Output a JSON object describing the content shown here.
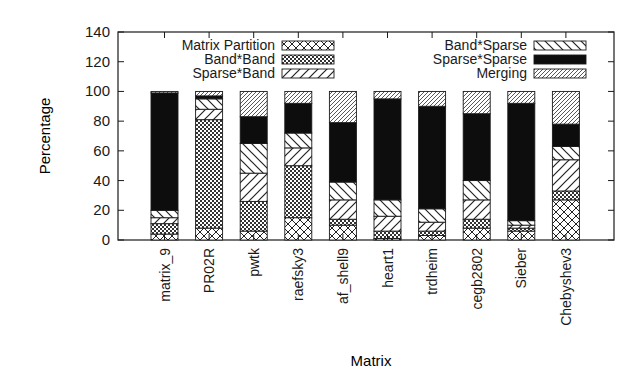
{
  "chart_data": {
    "type": "bar",
    "stacked": true,
    "title": "",
    "xlabel": "Matrix",
    "ylabel": "Percentage",
    "ylim": [
      0,
      140
    ],
    "yticks": [
      0,
      20,
      40,
      60,
      80,
      100,
      120,
      140
    ],
    "grid": false,
    "legend_position": "top-inside, two columns",
    "categories": [
      "matrix_9",
      "PR02R",
      "pwtk",
      "raefsky3",
      "af_shell9",
      "heart1",
      "trdheim",
      "cegb2802",
      "Sieber",
      "Chebyshev3"
    ],
    "series": [
      {
        "name": "Matrix Partition",
        "pattern": "crosshatch",
        "values": [
          4,
          8,
          6,
          15,
          10,
          1,
          3,
          8,
          6,
          27
        ]
      },
      {
        "name": "Band*Band",
        "pattern": "checker",
        "values": [
          7,
          73,
          20,
          35,
          4,
          5,
          3,
          6,
          2,
          6
        ]
      },
      {
        "name": "Sparse*Band",
        "pattern": "diag-forward",
        "values": [
          4,
          7,
          19,
          12,
          13,
          10,
          6,
          13,
          2,
          21
        ]
      },
      {
        "name": "Band*Sparse",
        "pattern": "diag-backward",
        "values": [
          5,
          7,
          20,
          10,
          12,
          11,
          9,
          13,
          3,
          9
        ]
      },
      {
        "name": "Sparse*Sparse",
        "pattern": "solid-black",
        "values": [
          79,
          2,
          18,
          20,
          40,
          68,
          69,
          45,
          79,
          15
        ]
      },
      {
        "name": "Merging",
        "pattern": "diag-fine",
        "values": [
          1,
          3,
          17,
          8,
          21,
          5,
          10,
          15,
          8,
          22
        ]
      }
    ]
  },
  "colors": {
    "ink": "#1a1a1a",
    "fill_dark": "#0d0d0d",
    "background": "#ffffff"
  }
}
